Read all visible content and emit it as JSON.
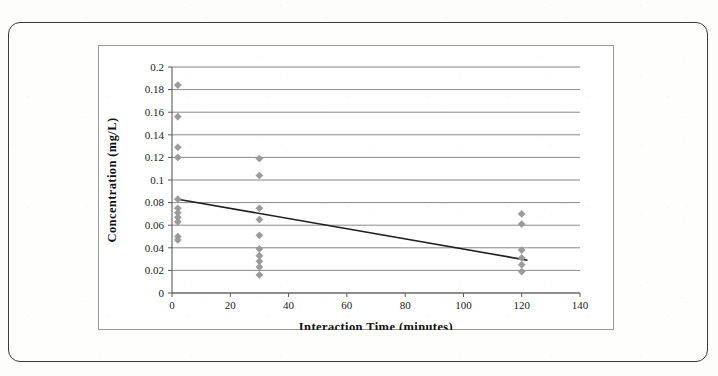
{
  "figure": {
    "frame_color": "#3a3a3a",
    "background_color": "#fdfdfc"
  },
  "chart_data": {
    "type": "scatter",
    "title": "",
    "xlabel": "Interaction  Time (minutes)",
    "ylabel": "Concentration  (mg/L)",
    "xlim": [
      0,
      140
    ],
    "ylim": [
      0,
      0.2
    ],
    "xticks": [
      0,
      20,
      40,
      60,
      80,
      100,
      120,
      140
    ],
    "xtick_labels": [
      "0",
      "20",
      "40",
      "60",
      "80",
      "100",
      "120",
      "140"
    ],
    "yticks": [
      0,
      0.02,
      0.04,
      0.06,
      0.08,
      0.1,
      0.12,
      0.14,
      0.16,
      0.18,
      0.2
    ],
    "ytick_labels": [
      "0",
      "0.02",
      "0.04",
      "0.06",
      "0.08",
      "0.1",
      "0.12",
      "0.14",
      "0.16",
      "0.18",
      "0.2"
    ],
    "grid": "horizontal",
    "legend": "none",
    "marker_color": "#9b9b9b",
    "marker_shape": "diamond",
    "series": [
      {
        "name": "Concentration measurements",
        "points": [
          [
            2,
            0.184
          ],
          [
            2,
            0.156
          ],
          [
            2,
            0.129
          ],
          [
            2,
            0.12
          ],
          [
            2,
            0.083
          ],
          [
            2,
            0.075
          ],
          [
            2,
            0.071
          ],
          [
            2,
            0.067
          ],
          [
            2,
            0.063
          ],
          [
            2,
            0.05
          ],
          [
            2,
            0.047
          ],
          [
            30,
            0.119
          ],
          [
            30,
            0.104
          ],
          [
            30,
            0.075
          ],
          [
            30,
            0.065
          ],
          [
            30,
            0.051
          ],
          [
            30,
            0.039
          ],
          [
            30,
            0.033
          ],
          [
            30,
            0.028
          ],
          [
            30,
            0.023
          ],
          [
            30,
            0.016
          ],
          [
            120,
            0.07
          ],
          [
            120,
            0.061
          ],
          [
            120,
            0.038
          ],
          [
            120,
            0.031
          ],
          [
            120,
            0.025
          ],
          [
            120,
            0.019
          ]
        ]
      }
    ],
    "trendline": {
      "name": "Linear trend",
      "x_start": 2,
      "y_start": 0.083,
      "x_end": 122,
      "y_end": 0.029,
      "color": "#1f1f1f"
    }
  }
}
